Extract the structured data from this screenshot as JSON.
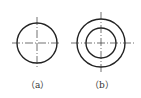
{
  "figures": [
    {
      "id": "a",
      "label": "（a）",
      "center": [
        37,
        43
      ],
      "circles": [
        20
      ],
      "centerline_h": [
        12,
        60
      ],
      "centerline_v": [
        17,
        68
      ]
    },
    {
      "id": "b",
      "label": "（b）",
      "center": [
        101,
        43
      ],
      "circles": [
        24,
        15
      ],
      "centerline_h": [
        71,
        134
      ],
      "centerline_v": [
        12,
        72
      ]
    }
  ],
  "colors": {
    "stroke": "#222222",
    "centerline": "#333333",
    "background": "#ffffff"
  }
}
